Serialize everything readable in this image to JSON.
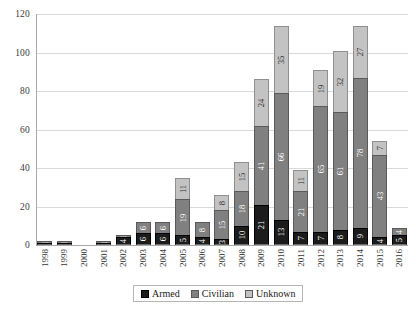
{
  "chart_data": {
    "type": "bar",
    "stacked": true,
    "title": "",
    "xlabel": "",
    "ylabel": "",
    "ylim": [
      0,
      120
    ],
    "yticks": [
      0,
      20,
      40,
      60,
      80,
      100,
      120
    ],
    "grid": true,
    "legend_position": "bottom",
    "categories": [
      "1998",
      "1999",
      "2000",
      "2001",
      "2002",
      "2003",
      "2004",
      "2005",
      "2006",
      "2007",
      "2008",
      "2009",
      "2010",
      "2011",
      "2012",
      "2013",
      "2014",
      "2015",
      "2016"
    ],
    "series": [
      {
        "name": "Armed",
        "color": "#1c1c1c",
        "values": [
          1,
          1,
          0,
          1,
          4,
          6,
          6,
          5,
          4,
          3,
          10,
          21,
          13,
          7,
          7,
          8,
          9,
          4,
          5
        ]
      },
      {
        "name": "Civilian",
        "color": "#808080",
        "values": [
          1,
          1,
          0,
          1,
          1,
          6,
          6,
          19,
          8,
          15,
          18,
          41,
          66,
          21,
          65,
          61,
          78,
          43,
          4
        ]
      },
      {
        "name": "Unknown",
        "color": "#c3c3c3",
        "values": [
          0,
          0,
          0,
          0,
          0,
          0,
          0,
          11,
          0,
          8,
          15,
          24,
          35,
          11,
          19,
          32,
          27,
          7,
          0
        ]
      }
    ],
    "totals": [
      2,
      2,
      0,
      2,
      5,
      12,
      12,
      35,
      12,
      26,
      43,
      86,
      114,
      39,
      91,
      101,
      114,
      54,
      9
    ]
  },
  "legend": {
    "items": [
      {
        "label": "Armed",
        "swatch": "armed-swatch"
      },
      {
        "label": "Civilian",
        "swatch": "civilian-swatch"
      },
      {
        "label": "Unknown",
        "swatch": "unknown-swatch"
      }
    ]
  }
}
